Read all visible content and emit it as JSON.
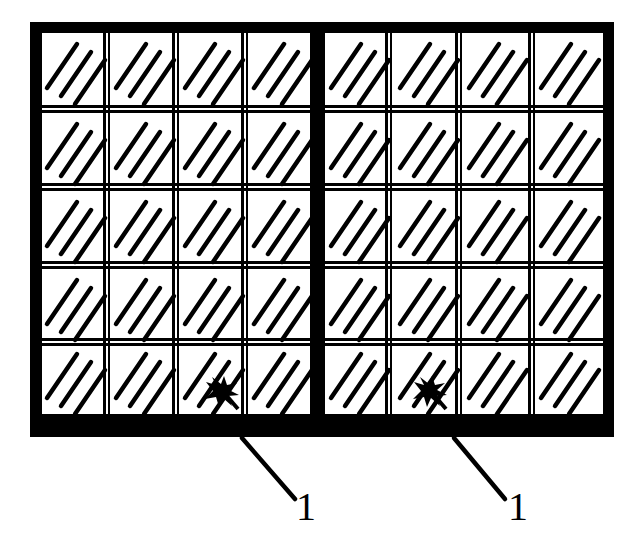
{
  "figure": {
    "kind": "patent-line-drawing",
    "title": "",
    "background_color": "#ffffff",
    "ink_color": "#000000",
    "panel": {
      "name": "outer-frame",
      "x": 30,
      "y": 22,
      "width": 584,
      "height": 415,
      "border_thickness_top": 11,
      "border_thickness_left": 12,
      "border_thickness_right": 11,
      "border_thickness_bottom": 23
    },
    "grid": {
      "rows": 5,
      "columns": 8,
      "column_groups": 2,
      "columns_per_group": 4,
      "center_divider_thickness": 15,
      "inner_divider_thickness": 3,
      "row_divider_thickness": 3,
      "cell_fill": "#ffffff",
      "cell_hatch": {
        "name": "diagonal-hatch",
        "stroke_count": 3,
        "direction": "lower-left-to-upper-right",
        "stroke_width": 4
      }
    },
    "markers": [
      {
        "name": "burst-marker-left",
        "type": "star-burst",
        "row": 5,
        "column": 3,
        "x": 220,
        "y": 392
      },
      {
        "name": "burst-marker-right",
        "type": "star-burst",
        "row": 5,
        "column": 6,
        "x": 428,
        "y": 392
      }
    ],
    "callouts": [
      {
        "name": "callout-left",
        "label": "1",
        "leader_from_x": 242,
        "leader_from_y": 437,
        "leader_to_x": 295,
        "leader_to_y": 498,
        "label_x": 296,
        "label_y": 487
      },
      {
        "name": "callout-right",
        "label": "1",
        "leader_from_x": 454,
        "leader_from_y": 437,
        "leader_to_x": 505,
        "leader_to_y": 498,
        "label_x": 508,
        "label_y": 487
      }
    ]
  },
  "labels": {
    "left_reference_numeral": "1",
    "right_reference_numeral": "1"
  }
}
